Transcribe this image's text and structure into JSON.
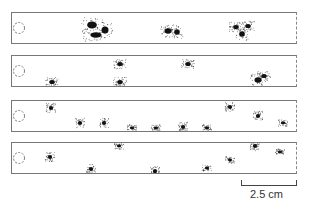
{
  "figure": {
    "strips": [
      {
        "id": 1,
        "blobs": [
          [
            80,
            12,
            7,
            5
          ],
          [
            84,
            22,
            8,
            4
          ],
          [
            93,
            17,
            5,
            5
          ],
          [
            156,
            18,
            5,
            4
          ],
          [
            165,
            19,
            4,
            4
          ],
          [
            224,
            14,
            4,
            3
          ],
          [
            230,
            21,
            4,
            4
          ],
          [
            236,
            13,
            4,
            3
          ]
        ]
      },
      {
        "id": 2,
        "blobs": [
          [
            40,
            26,
            4,
            3
          ],
          [
            108,
            8,
            4,
            3
          ],
          [
            108,
            26,
            4,
            3
          ],
          [
            176,
            8,
            4,
            3
          ],
          [
            246,
            24,
            5,
            4
          ],
          [
            252,
            20,
            4,
            3
          ]
        ]
      },
      {
        "id": 3,
        "blobs": [
          [
            39,
            7,
            3,
            3
          ],
          [
            68,
            22,
            3,
            3
          ],
          [
            92,
            22,
            3,
            3
          ],
          [
            120,
            27,
            3,
            2
          ],
          [
            144,
            27,
            3,
            2
          ],
          [
            171,
            26,
            3,
            3
          ],
          [
            195,
            27,
            3,
            2
          ],
          [
            218,
            6,
            3,
            3
          ],
          [
            246,
            15,
            3,
            3
          ],
          [
            271,
            22,
            3,
            2
          ]
        ]
      },
      {
        "id": 4,
        "blobs": [
          [
            38,
            14,
            3,
            3
          ],
          [
            79,
            26,
            3,
            3
          ],
          [
            107,
            3,
            3,
            2
          ],
          [
            143,
            28,
            3,
            3
          ],
          [
            195,
            25,
            3,
            2
          ],
          [
            218,
            17,
            3,
            2
          ],
          [
            243,
            3,
            3,
            3
          ],
          [
            268,
            9,
            3,
            2
          ]
        ]
      }
    ],
    "scale_bar": {
      "label": "2.5 cm"
    }
  }
}
